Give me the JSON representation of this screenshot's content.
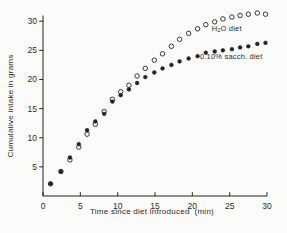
{
  "figure": {
    "background_color": "#fbfbf9",
    "ink_color": "#232323"
  },
  "chart_data": {
    "type": "scatter",
    "title": "",
    "xlabel": "Time since diet introduced  (min)",
    "ylabel": "Cumulative intake in grams",
    "xlim": [
      0,
      30
    ],
    "ylim": [
      0,
      30
    ],
    "x_ticks": [
      0,
      5,
      10,
      15,
      20,
      25,
      30
    ],
    "y_ticks": [
      5,
      10,
      15,
      20,
      25,
      30
    ],
    "grid": false,
    "x": [
      1.0,
      2.4,
      3.6,
      4.8,
      5.9,
      7.0,
      8.2,
      9.3,
      10.4,
      11.5,
      12.6,
      13.7,
      14.9,
      16.0,
      17.2,
      18.3,
      19.5,
      20.7,
      21.8,
      23.0,
      24.1,
      25.3,
      26.4,
      27.5,
      28.7,
      29.8
    ],
    "series": [
      {
        "name": "H2O diet",
        "marker": "open-circle",
        "color": "#232323",
        "values": [
          2.1,
          4.2,
          6.2,
          8.4,
          10.6,
          12.3,
          14.5,
          16.6,
          17.9,
          19.0,
          20.6,
          21.9,
          23.3,
          24.4,
          25.7,
          26.9,
          27.9,
          28.7,
          29.4,
          29.9,
          30.4,
          30.7,
          31.0,
          31.2,
          31.4,
          31.2
        ]
      },
      {
        "name": "0.10% sacch. diet",
        "marker": "filled-circle",
        "color": "#232323",
        "values": [
          2.1,
          4.2,
          6.6,
          8.9,
          11.3,
          12.8,
          14.1,
          16.2,
          17.3,
          18.3,
          19.4,
          20.4,
          21.2,
          21.9,
          22.5,
          23.1,
          23.6,
          24.0,
          24.6,
          24.8,
          25.0,
          25.2,
          25.5,
          25.7,
          26.1,
          26.3
        ]
      }
    ],
    "legend": {
      "h2o": {
        "base": "H",
        "sub": "2",
        "rest": "O diet",
        "x": 24.6,
        "y": 28.4
      },
      "sacch": {
        "label": "0.10% sacch. diet",
        "x": 25.2,
        "y": 23.5
      }
    }
  }
}
